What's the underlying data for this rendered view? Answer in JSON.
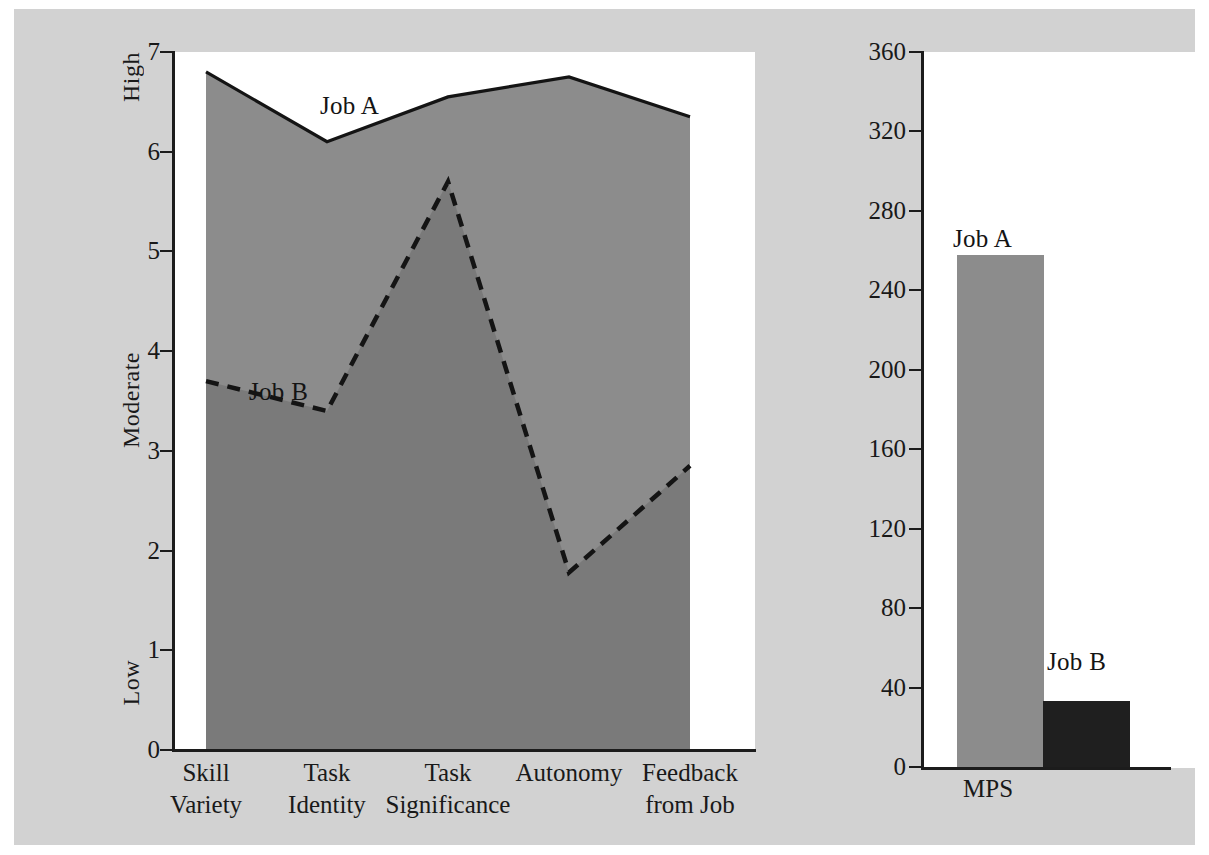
{
  "figure": {
    "background_color": "#d2d2d2",
    "panel_color": "#ffffff",
    "job_a_color": "#8c8c8c",
    "job_b_color": "#7a7a7a",
    "job_b_bar_color": "#1f1f1f",
    "axis_color": "#1c1c1c"
  },
  "chart_data": [
    {
      "type": "area",
      "id": "job-characteristics-profile",
      "title": "",
      "xlabel": "",
      "ylabel": "",
      "ylim": [
        0,
        7
      ],
      "yticks": [
        0,
        1,
        2,
        3,
        4,
        5,
        6,
        7
      ],
      "ytick_labels": [
        "0",
        "1",
        "2",
        "3",
        "4",
        "5",
        "6",
        "7"
      ],
      "y_anchor_labels": [
        {
          "text": "High",
          "value": 7
        },
        {
          "text": "Moderate",
          "value": 4
        },
        {
          "text": "Low",
          "value": 0
        }
      ],
      "grid": false,
      "legend_position": "inline-annotation",
      "categories": [
        "Skill Variety",
        "Task Identity",
        "Task Significance",
        "Autonomy",
        "Feedback from Job"
      ],
      "category_lines": [
        [
          "Skill",
          "Variety"
        ],
        [
          "Task",
          "Identity"
        ],
        [
          "Task",
          "Significance"
        ],
        [
          "Autonomy",
          ""
        ],
        [
          "Feedback",
          "from Job"
        ]
      ],
      "series": [
        {
          "name": "Job A",
          "style": "solid",
          "fill": "#8c8c8c",
          "values": [
            6.8,
            6.1,
            6.55,
            6.75,
            6.35
          ]
        },
        {
          "name": "Job B",
          "style": "dashed",
          "fill": "#7a7a7a",
          "values": [
            3.7,
            3.4,
            5.7,
            1.78,
            2.85
          ]
        }
      ],
      "annotations": [
        {
          "text": "Job A",
          "series": "Job A"
        },
        {
          "text": "Job B",
          "series": "Job B"
        }
      ]
    },
    {
      "type": "bar",
      "id": "motivating-potential-score",
      "title": "",
      "xlabel": "",
      "ylabel": "",
      "ylim": [
        0,
        360
      ],
      "yticks": [
        0,
        40,
        80,
        120,
        160,
        200,
        240,
        280,
        320,
        360
      ],
      "ytick_labels": [
        "0",
        "40",
        "80",
        "120",
        "160",
        "200",
        "240",
        "280",
        "320",
        "360"
      ],
      "grid": false,
      "categories": [
        "MPS"
      ],
      "bars": [
        {
          "name": "Job A",
          "value": 258,
          "color": "#8c8c8c"
        },
        {
          "name": "Job B",
          "value": 33,
          "color": "#1f1f1f"
        }
      ],
      "annotations": [
        {
          "text": "Job A"
        },
        {
          "text": "Job B"
        }
      ]
    }
  ]
}
